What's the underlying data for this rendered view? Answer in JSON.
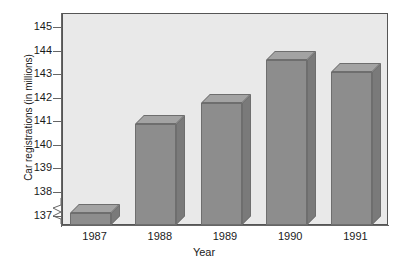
{
  "chart_data": {
    "type": "bar",
    "title": "",
    "xlabel": "Year",
    "ylabel": "Car registrations (in millions)",
    "categories": [
      "1987",
      "1988",
      "1989",
      "1990",
      "1991"
    ],
    "values": [
      137.1,
      140.9,
      141.8,
      143.6,
      143.1
    ],
    "ylim": [
      136.6,
      145.6
    ],
    "yticks": [
      137,
      138,
      139,
      140,
      141,
      142,
      143,
      144,
      145
    ],
    "ytick_labels": [
      "137",
      "138",
      "139",
      "140",
      "141",
      "142",
      "143",
      "144",
      "145"
    ],
    "grid": false,
    "legend": null,
    "axis_break": true,
    "style": "3d-bar",
    "colors": {
      "bar_front": "#8d8d8d",
      "bar_top": "#a3a3a3",
      "bar_side": "#7a7a7a",
      "bar_edge": "#6e6e6e",
      "plot_background": "#e9e9e9",
      "plot_border": "#555555",
      "axis": "#666666",
      "text": "#1a1a1a",
      "page_background": "#ffffff"
    }
  }
}
